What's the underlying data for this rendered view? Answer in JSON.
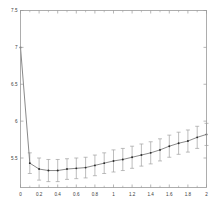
{
  "figure": {
    "background_color": "#ffffff",
    "axes_color": "#9a9a9a",
    "line_color": "#6b6b6b",
    "marker_color": "#2a2a2a",
    "errorbar_color": "#a0a0a0",
    "tick_label_color": "#3a3a3a"
  },
  "chart_data": {
    "type": "line",
    "title": "",
    "xlabel": "",
    "ylabel": "",
    "xlim": [
      0,
      2
    ],
    "ylim": [
      5.1,
      7.5
    ],
    "grid": false,
    "legend": null,
    "x_ticks": [
      0,
      0.2,
      0.4,
      0.6,
      0.8,
      1,
      1.2,
      1.4,
      1.6,
      1.8,
      2
    ],
    "x_tick_labels": [
      "0",
      "0.2",
      "0.4",
      "0.6",
      "0.8",
      "1",
      "1.2",
      "1.4",
      "1.6",
      "1.8",
      "2"
    ],
    "x_minor_ticks": [
      0.1,
      0.3,
      0.5,
      0.7,
      0.9,
      1.1,
      1.3,
      1.5,
      1.7,
      1.9
    ],
    "y_ticks": [
      5.5,
      6,
      6.5,
      7,
      7.5
    ],
    "y_tick_labels": [
      "5.5",
      "6",
      "6.5",
      "7",
      "7.5"
    ],
    "series": [
      {
        "name": "mean with error bars",
        "marker": "dot",
        "x": [
          0,
          0.1,
          0.2,
          0.3,
          0.4,
          0.5,
          0.6,
          0.7,
          0.8,
          0.9,
          1.0,
          1.1,
          1.2,
          1.3,
          1.4,
          1.5,
          1.6,
          1.7,
          1.8,
          1.9,
          2.0
        ],
        "values": [
          7.0,
          5.43,
          5.35,
          5.33,
          5.33,
          5.35,
          5.36,
          5.37,
          5.4,
          5.43,
          5.46,
          5.48,
          5.51,
          5.54,
          5.57,
          5.61,
          5.66,
          5.7,
          5.73,
          5.78,
          5.82
        ],
        "yerr": [
          0,
          0.14,
          0.15,
          0.15,
          0.15,
          0.14,
          0.14,
          0.14,
          0.14,
          0.14,
          0.15,
          0.15,
          0.15,
          0.15,
          0.15,
          0.15,
          0.15,
          0.15,
          0.15,
          0.15,
          0.15
        ]
      }
    ]
  }
}
